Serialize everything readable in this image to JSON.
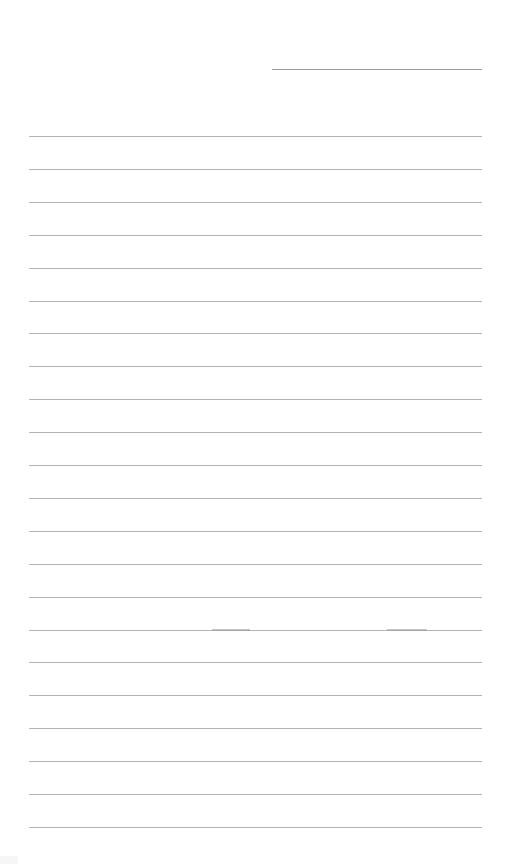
{
  "document": {
    "type": "lined-paper",
    "header_line": {
      "x": 272,
      "y": 69,
      "width": 210
    },
    "rules": {
      "count": 22,
      "first_y": 136,
      "spacing": 32.9,
      "x": 29,
      "width": 453,
      "color": "#b4b4b4"
    },
    "text": ""
  }
}
